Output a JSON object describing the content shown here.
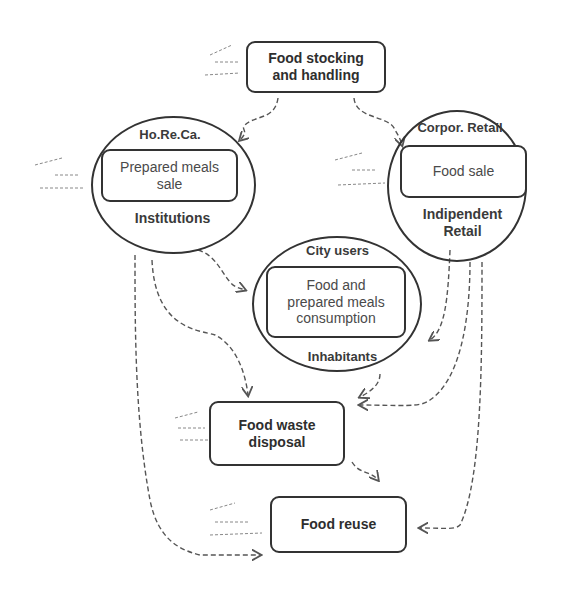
{
  "nodes": {
    "stocking": {
      "label_line1": "Food stocking",
      "label_line2": "and handling"
    },
    "horeca": {
      "top_label": "Ho.Re.Ca.",
      "inner_line1": "Prepared meals",
      "inner_line2": "sale",
      "bottom_label": "Institutions"
    },
    "retail": {
      "top_label": "Corpor. Retail",
      "inner": "Food sale",
      "bottom_line1": "Indipendent",
      "bottom_line2": "Retail"
    },
    "city": {
      "top_label": "City users",
      "inner_line1": "Food and",
      "inner_line2": "prepared meals",
      "inner_line3": "consumption",
      "bottom_label": "Inhabitants"
    },
    "waste": {
      "label_line1": "Food waste",
      "label_line2": "disposal"
    },
    "reuse": {
      "label": "Food reuse"
    }
  },
  "colors": {
    "stroke": "#333333",
    "text": "#3a3a3a",
    "background": "#ffffff"
  }
}
